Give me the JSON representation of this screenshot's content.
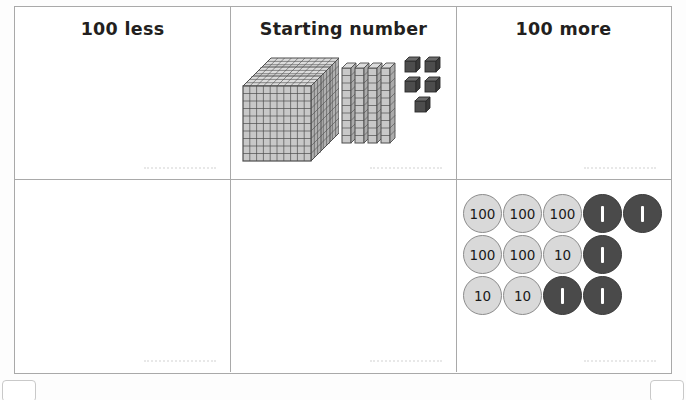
{
  "worksheet": {
    "columns": [
      {
        "id": "less",
        "title": "100 less"
      },
      {
        "id": "start",
        "title": "Starting number"
      },
      {
        "id": "more",
        "title": "100 more"
      }
    ],
    "base_ten_blocks": {
      "hundreds_flats": 3,
      "tens_rods": 4,
      "ones_cubes": 5,
      "represented_number": "345",
      "flat_grid_columns": 10,
      "flat_grid_rows": 10,
      "rod_segments": 10
    },
    "place_value_counters": {
      "rows": [
        [
          {
            "label": "100",
            "style": "light"
          },
          {
            "label": "100",
            "style": "light"
          },
          {
            "label": "100",
            "style": "light"
          },
          {
            "label": "1",
            "style": "dark"
          },
          {
            "label": "1",
            "style": "dark"
          }
        ],
        [
          {
            "label": "100",
            "style": "light"
          },
          {
            "label": "100",
            "style": "light"
          },
          {
            "label": "10",
            "style": "light"
          },
          {
            "label": "1",
            "style": "dark"
          }
        ],
        [
          {
            "label": "10",
            "style": "light"
          },
          {
            "label": "10",
            "style": "light"
          },
          {
            "label": "1",
            "style": "dark"
          },
          {
            "label": "1",
            "style": "dark"
          }
        ]
      ],
      "hundreds_count": 5,
      "tens_count": 3,
      "ones_count": 5,
      "represented_number": "535"
    },
    "answer_line_placeholder": ""
  },
  "colors": {
    "table_border": "#a9a9a9",
    "text": "#231f20",
    "block_face": "#c4c4c4",
    "block_outline": "#555555",
    "ones_cube": "#4d4d4d",
    "counter_light_fill": "#d9d9d9",
    "counter_light_border": "#8c8c8c",
    "counter_dark_fill": "#4a4a4a",
    "counter_dark_text": "#ffffff",
    "answer_line": "#e8e8e8",
    "page_background": "#ffffff"
  }
}
